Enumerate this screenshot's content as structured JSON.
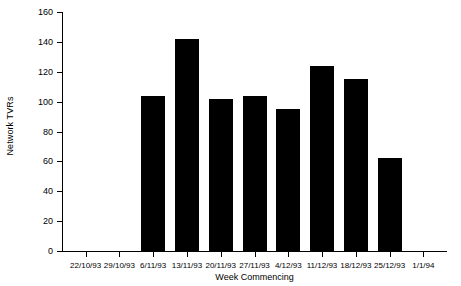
{
  "chart_data": {
    "type": "bar",
    "title": "",
    "xlabel": "Week Commencing",
    "ylabel": "Network TVRs",
    "ylim": [
      0,
      160
    ],
    "ystep": 20,
    "ytick_labels": [
      "0",
      "20",
      "40",
      "60",
      "80",
      "100",
      "120",
      "140",
      "160"
    ],
    "ytick_values": [
      0,
      20,
      40,
      60,
      80,
      100,
      120,
      140,
      160
    ],
    "categories": [
      "22/10/93",
      "29/10/93",
      "6/11/93",
      "13/11/93",
      "20/11/93",
      "27/11/93",
      "4/12/93",
      "11/12/93",
      "18/12/93",
      "25/12/93",
      "1/1/94"
    ],
    "values": [
      null,
      null,
      104,
      142,
      102,
      104,
      95,
      124,
      115,
      62,
      null
    ],
    "grid": false,
    "legend": false,
    "bar_color": "#000000"
  },
  "axes": {
    "y_title": "Network TVRs",
    "x_title": "Week Commencing"
  }
}
